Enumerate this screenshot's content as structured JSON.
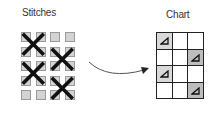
{
  "left_panel": {
    "title": "Stitches",
    "grid": {
      "rows": 5,
      "cols": 4
    },
    "cross_stitches": [
      {
        "row": 1,
        "col": 1,
        "span": 2
      },
      {
        "row": 2,
        "col": 3,
        "span": 2
      },
      {
        "row": 3,
        "col": 1,
        "span": 2
      },
      {
        "row": 4,
        "col": 3,
        "span": 2
      }
    ]
  },
  "arrow": {
    "direction": "left-to-right",
    "style": "curved"
  },
  "right_panel": {
    "title": "Chart",
    "grid": {
      "rows": 4,
      "cols": 3
    },
    "marked_cells": [
      {
        "row": 1,
        "col": 1,
        "symbol": "triangle",
        "shade": "#d9d9d9"
      },
      {
        "row": 2,
        "col": 3,
        "symbol": "triangle",
        "shade": "#bdbdbd"
      },
      {
        "row": 3,
        "col": 1,
        "symbol": "triangle",
        "shade": "#d9d9d9"
      },
      {
        "row": 4,
        "col": 3,
        "symbol": "triangle",
        "shade": "#bdbdbd"
      }
    ]
  }
}
